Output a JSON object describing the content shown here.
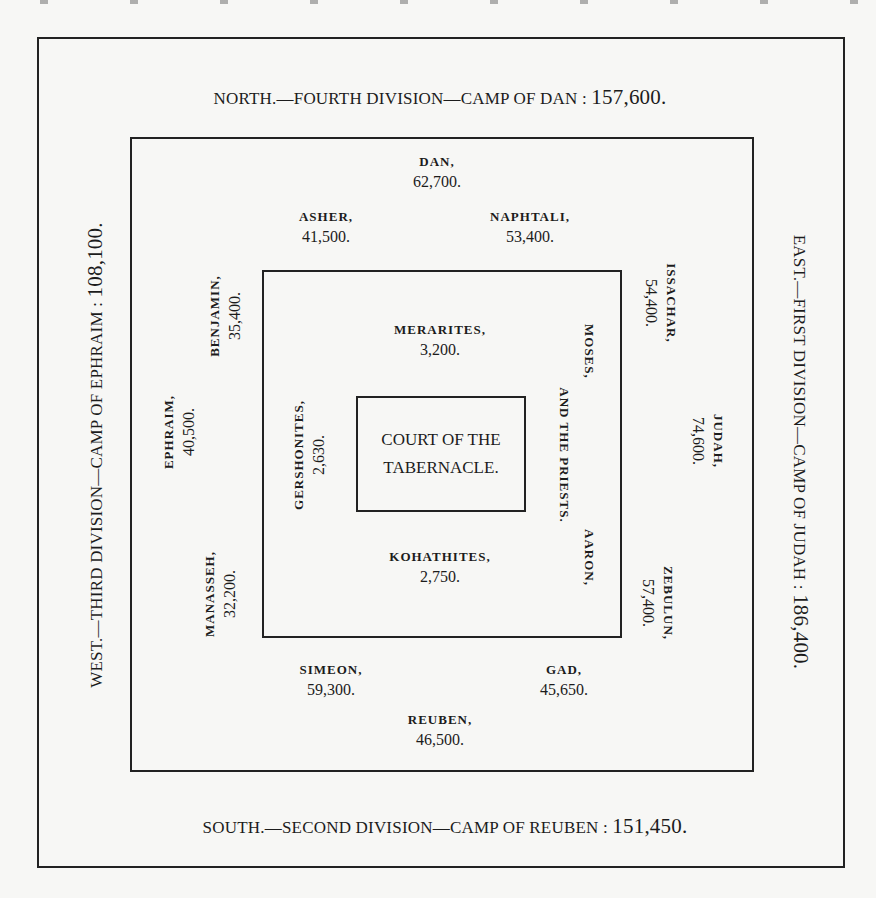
{
  "headings": {
    "north": {
      "text": "NORTH.—FOURTH DIVISION—CAMP OF DAN : ",
      "total": "157,600."
    },
    "south": {
      "text": "SOUTH.—SECOND DIVISION—CAMP OF REUBEN : ",
      "total": "151,450."
    },
    "west": {
      "text": "WEST.—THIRD DIVISION—CAMP OF EPHRAIM : ",
      "total": "108,100."
    },
    "east": {
      "text": "EAST.—FIRST DIVISION—CAMP OF JUDAH : ",
      "total": "186,400."
    }
  },
  "tribes": {
    "dan": {
      "name": "DAN,",
      "count": "62,700."
    },
    "asher": {
      "name": "ASHER,",
      "count": "41,500."
    },
    "naphtali": {
      "name": "NAPHTALI,",
      "count": "53,400."
    },
    "benjamin": {
      "name": "BENJAMIN,",
      "count": "35,400."
    },
    "ephraim": {
      "name": "EPHRAIM,",
      "count": "40,500."
    },
    "manasseh": {
      "name": "MANASSEH,",
      "count": "32,200."
    },
    "issachar": {
      "name": "ISSACHAR,",
      "count": "54,400."
    },
    "judah": {
      "name": "JUDAH,",
      "count": "74,600."
    },
    "zebulun": {
      "name": "ZEBULUN,",
      "count": "57,400."
    },
    "simeon": {
      "name": "SIMEON,",
      "count": "59,300."
    },
    "gad": {
      "name": "GAD,",
      "count": "45,650."
    },
    "reuben": {
      "name": "REUBEN,",
      "count": "46,500."
    }
  },
  "levites": {
    "merarites": {
      "name": "MERARITES,",
      "count": "3,200."
    },
    "kohathites": {
      "name": "KOHATHITES,",
      "count": "2,750."
    },
    "gershonites": {
      "name": "GERSHONITES,",
      "count": "2,630."
    },
    "priests": {
      "line1": "MOSES,",
      "line2": "AND THE PRIESTS.",
      "line3": "AARON,"
    }
  },
  "court": {
    "line1": "COURT OF THE",
    "line2": "TABERNACLE."
  }
}
